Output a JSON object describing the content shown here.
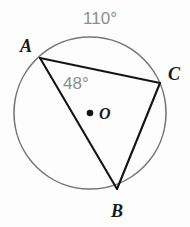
{
  "figure": {
    "background_color": "#fdfdfd",
    "circle": {
      "name": "circle-O",
      "center_x": 90,
      "center_y": 113,
      "radius": 76,
      "stroke_color": "#777777",
      "stroke_width": 1.6
    },
    "center_point": {
      "label": "O",
      "dot_x": 90,
      "dot_y": 113,
      "dot_radius": 3.3,
      "dot_color": "#141414",
      "label_x": 99,
      "label_y": 119
    },
    "vertices": [
      {
        "label": "A",
        "x": 40,
        "y": 58,
        "label_x": 20,
        "label_y": 52
      },
      {
        "label": "C",
        "x": 160,
        "y": 83,
        "label_x": 168,
        "label_y": 80
      },
      {
        "label": "B",
        "x": 117,
        "y": 189,
        "label_x": 111,
        "label_y": 217
      }
    ],
    "chords": [
      {
        "name": "chord-AC",
        "from": "A",
        "to": "C"
      },
      {
        "name": "chord-AB",
        "from": "A",
        "to": "B"
      },
      {
        "name": "chord-CB",
        "from": "C",
        "to": "B"
      }
    ],
    "chord_stroke_color": "#141414",
    "chord_stroke_width": 2.1,
    "angle_labels": [
      {
        "name": "arc-AC-measure",
        "text": "110°",
        "x": 100,
        "y": 24,
        "color": "#8d8d8d",
        "anchor": "middle"
      },
      {
        "name": "inscribed-angle-A-measure",
        "text": "48°",
        "x": 63,
        "y": 89,
        "color": "#8d8d8d",
        "anchor": "start"
      }
    ]
  }
}
